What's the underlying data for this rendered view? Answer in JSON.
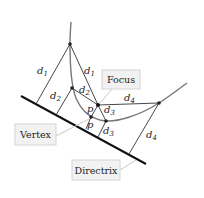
{
  "diagram": {
    "callouts": {
      "focus": "Focus",
      "vertex": "Vertex",
      "directrix": "Directrix"
    },
    "distance_labels": [
      {
        "id": "d1-left",
        "base": "d",
        "sub": "1"
      },
      {
        "id": "d1-right",
        "base": "d",
        "sub": "1"
      },
      {
        "id": "d2-left",
        "base": "d",
        "sub": "2"
      },
      {
        "id": "d2-right",
        "base": "d",
        "sub": "2"
      },
      {
        "id": "d3-upper",
        "base": "d",
        "sub": "3"
      },
      {
        "id": "d3-lower",
        "base": "d",
        "sub": "3"
      },
      {
        "id": "d4-upper",
        "base": "d",
        "sub": "4"
      },
      {
        "id": "d4-lower",
        "base": "d",
        "sub": "4"
      },
      {
        "id": "p-upper",
        "base": "p",
        "sub": ""
      },
      {
        "id": "p-lower",
        "base": "p",
        "sub": ""
      }
    ],
    "colors": {
      "curve": "#777777",
      "lines": "#333333",
      "directrix": "#111111",
      "box_fill": "#f2f2f2",
      "box_stroke": "#d4d4d4"
    }
  }
}
